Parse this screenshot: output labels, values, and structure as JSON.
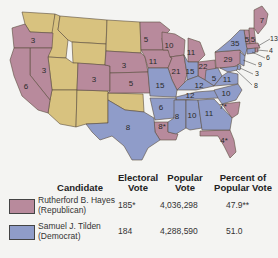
{
  "map": {
    "title": "Election of 1876",
    "colors": {
      "republican": "#b88a9c",
      "democrat": "#8f9cc9",
      "territory": "#d8c27f"
    },
    "state_labels": [
      {
        "id": "OR",
        "value": "3",
        "party": "republican"
      },
      {
        "id": "NV",
        "value": "3",
        "party": "republican"
      },
      {
        "id": "CA",
        "value": "6",
        "party": "republican"
      },
      {
        "id": "CO",
        "value": "3",
        "party": "republican"
      },
      {
        "id": "NE",
        "value": "3",
        "party": "republican"
      },
      {
        "id": "KS",
        "value": "5",
        "party": "republican"
      },
      {
        "id": "MN",
        "value": "5",
        "party": "republican"
      },
      {
        "id": "IA",
        "value": "11",
        "party": "republican"
      },
      {
        "id": "WI",
        "value": "10",
        "party": "republican"
      },
      {
        "id": "MI",
        "value": "11",
        "party": "republican"
      },
      {
        "id": "IL",
        "value": "21",
        "party": "republican"
      },
      {
        "id": "IN",
        "value": "15",
        "party": "democrat"
      },
      {
        "id": "OH",
        "value": "22",
        "party": "republican"
      },
      {
        "id": "PA",
        "value": "29",
        "party": "republican"
      },
      {
        "id": "NY",
        "value": "35",
        "party": "democrat"
      },
      {
        "id": "VT",
        "value": "5",
        "party": "republican"
      },
      {
        "id": "NH",
        "value": "5",
        "party": "republican"
      },
      {
        "id": "ME",
        "value": "7",
        "party": "republican"
      },
      {
        "id": "MA",
        "value": "13",
        "party": "republican"
      },
      {
        "id": "RI",
        "value": "4",
        "party": "republican"
      },
      {
        "id": "CT",
        "value": "6",
        "party": "democrat"
      },
      {
        "id": "NJ",
        "value": "9",
        "party": "democrat"
      },
      {
        "id": "DE",
        "value": "3",
        "party": "democrat"
      },
      {
        "id": "MD",
        "value": "8",
        "party": "democrat"
      },
      {
        "id": "WV",
        "value": "5",
        "party": "democrat"
      },
      {
        "id": "VA",
        "value": "11",
        "party": "democrat"
      },
      {
        "id": "MO",
        "value": "15",
        "party": "democrat"
      },
      {
        "id": "KY",
        "value": "12",
        "party": "democrat"
      },
      {
        "id": "TN",
        "value": "12",
        "party": "democrat"
      },
      {
        "id": "NC",
        "value": "10",
        "party": "democrat"
      },
      {
        "id": "SC",
        "value": "7*",
        "party": "republican"
      },
      {
        "id": "AR",
        "value": "6",
        "party": "democrat"
      },
      {
        "id": "MS",
        "value": "8",
        "party": "democrat"
      },
      {
        "id": "AL",
        "value": "10",
        "party": "democrat"
      },
      {
        "id": "GA",
        "value": "11",
        "party": "democrat"
      },
      {
        "id": "LA",
        "value": "8*",
        "party": "republican"
      },
      {
        "id": "FL",
        "value": "4*",
        "party": "republican"
      },
      {
        "id": "TX",
        "value": "8",
        "party": "democrat"
      }
    ]
  },
  "table": {
    "headers": {
      "candidate": "Candidate",
      "electoral_1": "Electoral",
      "electoral_2": "Vote",
      "popular_1": "Popular",
      "popular_2": "Vote",
      "percent_1": "Percent of",
      "percent_2": "Popular Vote"
    },
    "rows": [
      {
        "name": "Rutherford B. Hayes",
        "party": "(Republican)",
        "electoral": "185*",
        "popular": "4,036,298",
        "percent": "47.9**",
        "color": "#b88a9c"
      },
      {
        "name": "Samuel J. Tilden",
        "party": "(Democrat)",
        "electoral": "184",
        "popular": "4,288,590",
        "percent": "51.0",
        "color": "#8f9cc9"
      }
    ]
  }
}
